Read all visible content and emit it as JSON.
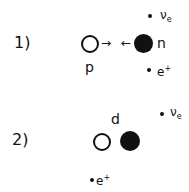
{
  "diagram": {
    "panel1": {
      "number": "1)",
      "proton_label": "p",
      "neutron_label": "n",
      "arrow_right": "→",
      "arrow_left": "←",
      "neutrino": {
        "symbol": "ν",
        "subscript": "e"
      },
      "positron": {
        "symbol": "e",
        "superscript": "+"
      }
    },
    "panel2": {
      "number": "2)",
      "deuteron_label": "d",
      "neutrino": {
        "symbol": "ν",
        "subscript": "e"
      },
      "positron": {
        "symbol": "e",
        "superscript": "+"
      }
    },
    "colors": {
      "ink": "#111111",
      "background": "#ffffff"
    }
  }
}
